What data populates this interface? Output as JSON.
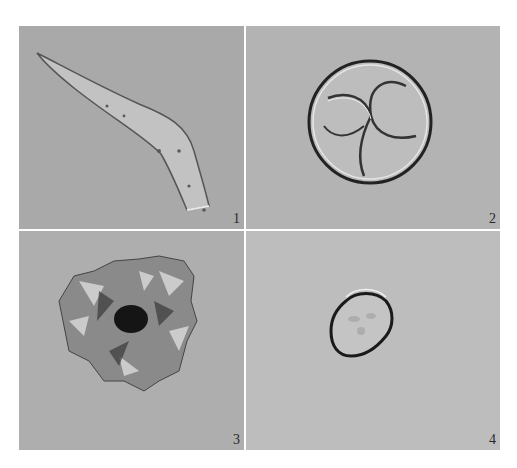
{
  "figure": {
    "panels": [
      {
        "id": 1,
        "label": "1",
        "subject": "elongated curved spindle-shaped specimen"
      },
      {
        "id": 2,
        "label": "2",
        "subject": "spherical specimen with four-part tetrad structure"
      },
      {
        "id": 3,
        "label": "3",
        "subject": "irregular spiny aggregate with dark center"
      },
      {
        "id": 4,
        "label": "4",
        "subject": "small round cell with thick dark wall"
      }
    ],
    "colors": {
      "background": "#ffffff",
      "panel_gray": "#b0b0b0"
    }
  }
}
